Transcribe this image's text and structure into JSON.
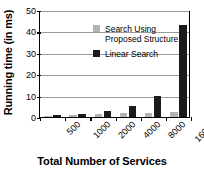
{
  "chart_data": {
    "type": "bar",
    "title": "",
    "xlabel": "Total Number of Services",
    "ylabel": "Running time (in ms)",
    "categories": [
      "500",
      "1000",
      "2000",
      "4000",
      "8000",
      "16000"
    ],
    "series": [
      {
        "name": "Search Using Proposed Structure",
        "color": "#b3b3b3",
        "values": [
          0.5,
          1.0,
          1.5,
          1.8,
          2.0,
          2.2
        ]
      },
      {
        "name": "Linear Search",
        "color": "#1a1a1a",
        "values": [
          0.8,
          1.6,
          2.7,
          5.0,
          10.0,
          43.0
        ]
      }
    ],
    "ylim": [
      0,
      50
    ],
    "yticks": [
      0,
      10,
      20,
      30,
      40,
      50
    ],
    "ytick_labels": [
      "0",
      "10",
      "20",
      "30",
      "40",
      "50"
    ],
    "grid": true,
    "legend_position": "upper left inside"
  },
  "legend": {
    "entries": [
      {
        "label": "Search Using\nProposed Structure",
        "swatch": "light-gray-swatch"
      },
      {
        "label": "Linear Search",
        "swatch": "black-swatch"
      }
    ]
  }
}
